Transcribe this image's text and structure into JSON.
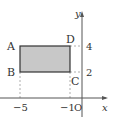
{
  "diagram": {
    "type": "coordinate-plane-rectangle",
    "axes": {
      "x_label": "x",
      "y_label": "y",
      "origin_label": "O"
    },
    "tick_labels": {
      "x_neg5": "−5",
      "x_neg1": "−1",
      "y_4": "4",
      "y_2": "2"
    },
    "points": {
      "A": {
        "label": "A",
        "x": -5,
        "y": 4
      },
      "B": {
        "label": "B",
        "x": -5,
        "y": 2
      },
      "C": {
        "label": "C",
        "x": -1,
        "y": 2
      },
      "D": {
        "label": "D",
        "x": -1,
        "y": 4
      }
    },
    "colors": {
      "fill": "#c8c8c8",
      "stroke": "#333333",
      "axis": "#555555",
      "dashed": "#999999"
    }
  }
}
